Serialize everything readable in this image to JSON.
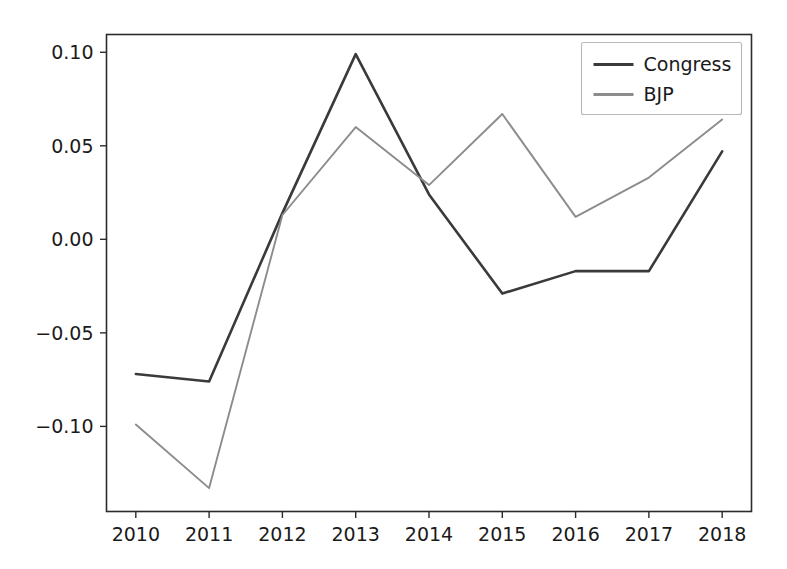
{
  "chart_data": {
    "type": "line",
    "title": "",
    "xlabel": "",
    "ylabel": "",
    "x": [
      2010,
      2011,
      2012,
      2013,
      2014,
      2015,
      2016,
      2017,
      2018
    ],
    "xtick_labels": [
      "2010",
      "2011",
      "2012",
      "2013",
      "2014",
      "2015",
      "2016",
      "2017",
      "2018"
    ],
    "ytick_labels": [
      "0.10",
      "0.05",
      "0.00",
      "−0.05",
      "−0.10"
    ],
    "ytick_values": [
      0.1,
      0.05,
      0.0,
      -0.05,
      -0.1
    ],
    "xlim": [
      2009.6,
      2018.4
    ],
    "ylim": [
      -0.1455,
      0.1095
    ],
    "grid": false,
    "legend_position": "upper right",
    "series": [
      {
        "name": "Congress",
        "color": "#3a3a3a",
        "linewidth": 2.6,
        "values": [
          -0.072,
          -0.076,
          0.014,
          0.099,
          0.024,
          -0.029,
          -0.017,
          -0.017,
          0.047
        ]
      },
      {
        "name": "BJP",
        "color": "#8c8c8c",
        "linewidth": 1.9,
        "values": [
          -0.099,
          -0.133,
          0.013,
          0.06,
          0.029,
          0.067,
          0.012,
          0.033,
          0.064
        ]
      }
    ]
  },
  "legend": {
    "entries": [
      {
        "label": "Congress"
      },
      {
        "label": "BJP"
      }
    ]
  },
  "axes": {
    "frame_color": "#2b2b2b"
  }
}
